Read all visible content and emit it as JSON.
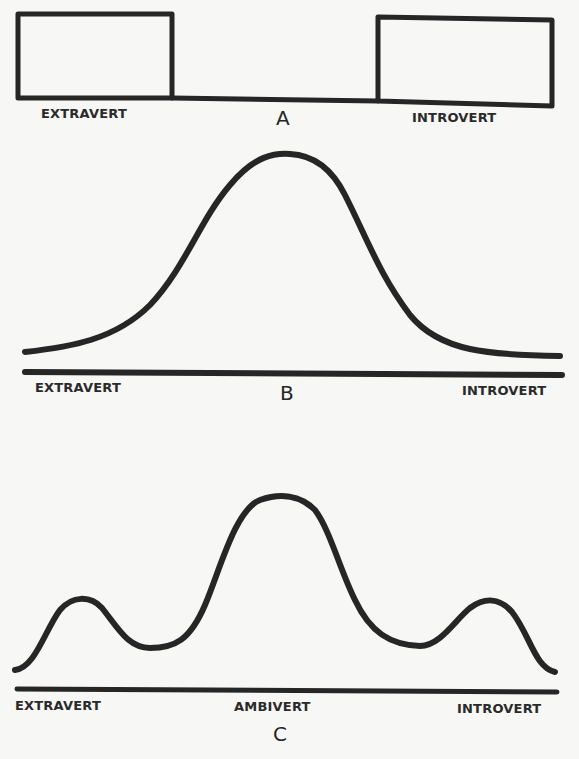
{
  "figure": {
    "panels": [
      {
        "id": "A",
        "letter": "A",
        "description": "Two discrete types: extravert and introvert blocks with no middle ground",
        "labels": {
          "left": "EXTRAVERT",
          "right": "INTROVERT"
        }
      },
      {
        "id": "B",
        "letter": "B",
        "description": "Unimodal normal (bell-shaped) distribution along the extravert-introvert continuum",
        "labels": {
          "left": "EXTRAVERT",
          "right": "INTROVERT"
        }
      },
      {
        "id": "C",
        "letter": "C",
        "description": "Trimodal distribution with small peaks at extravert and introvert ends and a large central peak at ambivert",
        "labels": {
          "left": "EXTRAVERT",
          "center": "AMBIVERT",
          "right": "INTROVERT"
        }
      }
    ]
  },
  "colors": {
    "background": "#f7f7f5",
    "ink": "#262626"
  }
}
